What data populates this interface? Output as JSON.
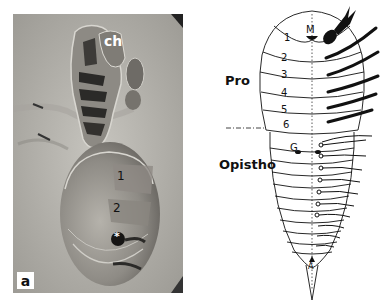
{
  "figure": {
    "panel_label": "a",
    "photo": {
      "labels": {
        "chelicera": "ch",
        "segment_1": "1",
        "segment_2": "2",
        "marker": "*"
      }
    },
    "schematic": {
      "region_labels": {
        "prosoma": "Pro",
        "opisthosoma": "Opistho"
      },
      "prosoma_segments": [
        "1",
        "2",
        "3",
        "4",
        "5",
        "6"
      ],
      "mouth_label": "M",
      "gonopore_label": "G",
      "anus_label": "A"
    }
  }
}
